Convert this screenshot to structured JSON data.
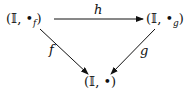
{
  "diagram": {
    "type": "commutative-triangle",
    "nodes": {
      "top_left": {
        "open": "(𝕀, •",
        "sub": "f",
        "close": ")"
      },
      "top_right": {
        "open": "(𝕀, •",
        "sub": "g",
        "close": ")"
      },
      "bottom": {
        "text": "(𝕀, •)"
      }
    },
    "arrows": {
      "h": {
        "label": "h",
        "from": "top_left",
        "to": "top_right"
      },
      "f": {
        "label": "f",
        "from": "top_left",
        "to": "bottom"
      },
      "g": {
        "label": "g",
        "from": "top_right",
        "to": "bottom"
      }
    },
    "colors": {
      "stroke": "#111111",
      "background": "#ffffff"
    }
  }
}
